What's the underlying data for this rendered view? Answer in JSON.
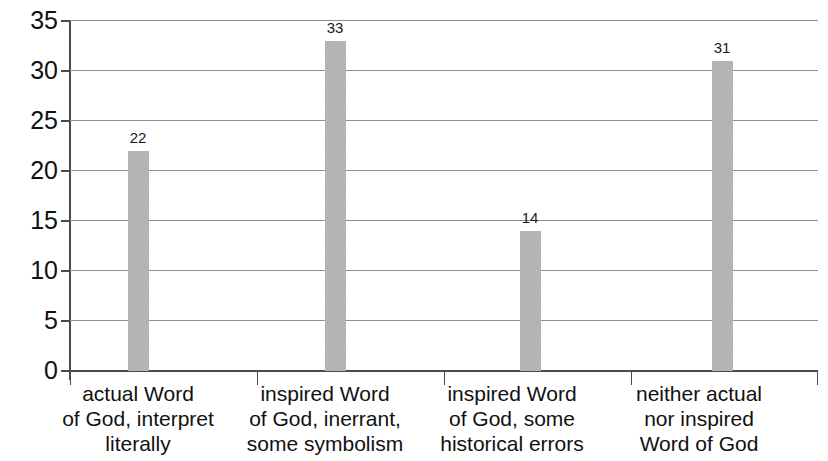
{
  "chart_data": {
    "type": "bar",
    "title": "",
    "subtitle": "",
    "xlabel": "",
    "ylabel": "",
    "ylim": [
      0,
      35
    ],
    "ytick_step": 5,
    "yticks": [
      "0",
      "5",
      "10",
      "15",
      "20",
      "25",
      "30",
      "35"
    ],
    "grid": "horizontal",
    "legend": "none",
    "categories": [
      "actual Word of God, interpret literally",
      "inspired Word of God, inerrant, some symbolism",
      "inspired Word of God, some historical errors",
      "neither actual nor inspired Word of God"
    ],
    "category_lines": [
      [
        "actual Word",
        "of God, interpret",
        "literally"
      ],
      [
        "inspired Word",
        "of God, inerrant,",
        "some symbolism"
      ],
      [
        "inspired Word",
        "of God, some",
        "historical errors"
      ],
      [
        "neither actual",
        "nor inspired",
        "Word of God"
      ]
    ],
    "values": [
      22,
      33,
      14,
      31
    ],
    "value_labels": [
      "22",
      "33",
      "14",
      "31"
    ],
    "bar_color": "#a9a9a9",
    "axis_color": "#4a4a4a",
    "gridline_color": "#8f8f8f",
    "background_color": "#ffffff"
  }
}
